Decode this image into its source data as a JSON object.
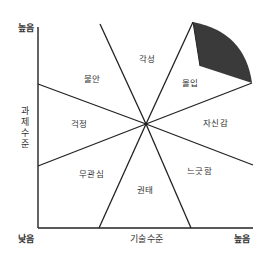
{
  "diagram": {
    "type": "flow-channel-model",
    "axes": {
      "y_title": "과제수준",
      "y_title_chars": [
        "과",
        "제",
        "수",
        "준"
      ],
      "x_title": "기술수준",
      "y_high": "높음",
      "origin_low": "낮음",
      "x_high": "높음"
    },
    "regions": [
      {
        "id": "arousal",
        "label": "각성"
      },
      {
        "id": "flow",
        "label": "몰입"
      },
      {
        "id": "control",
        "label": "자신감"
      },
      {
        "id": "relaxation",
        "label": "느긋함"
      },
      {
        "id": "boredom",
        "label": "권태"
      },
      {
        "id": "apathy",
        "label": "무관심"
      },
      {
        "id": "worry",
        "label": "걱정"
      },
      {
        "id": "anxiety",
        "label": "불안"
      }
    ],
    "colors": {
      "line": "#222222",
      "shaded_wedge": "#3a3a3a",
      "background": "#ffffff"
    }
  }
}
